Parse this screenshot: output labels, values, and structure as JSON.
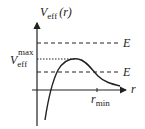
{
  "diagram": {
    "type": "effective-potential-plot",
    "y_axis_label": "V",
    "y_axis_label_sub": "eff",
    "y_axis_label_arg": "(r)",
    "x_axis_label": "r",
    "vmax_label": "V",
    "vmax_label_sub": "eff",
    "vmax_label_sup": "max",
    "energy_upper_label": "E",
    "energy_lower_label": "E",
    "rmin_label": "r",
    "rmin_label_sub": "min",
    "colors": {
      "line": "#222222",
      "background": "#ffffff"
    }
  }
}
